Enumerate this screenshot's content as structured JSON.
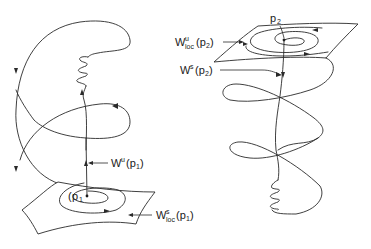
{
  "figure": {
    "left_panel": {
      "point_label": "p",
      "point_subscript": "1",
      "unstable_manifold_label": {
        "main": "W",
        "sup": "u",
        "arg": "(p",
        "arg_sub": "1",
        "close": ")"
      },
      "local_stable_manifold_label": {
        "main": "W",
        "sup": "s",
        "sub": "loc",
        "arg": "(p",
        "arg_sub": "1",
        "close": ")"
      }
    },
    "right_panel": {
      "point_label": "p",
      "point_subscript": "2",
      "local_unstable_manifold_label": {
        "main": "W",
        "sup": "u",
        "sub": "loc",
        "arg": "(p",
        "arg_sub": "2",
        "close": ")"
      },
      "stable_manifold_label": {
        "main": "W",
        "sup": "s",
        "arg": "(p",
        "arg_sub": "2",
        "close": ")"
      }
    }
  }
}
